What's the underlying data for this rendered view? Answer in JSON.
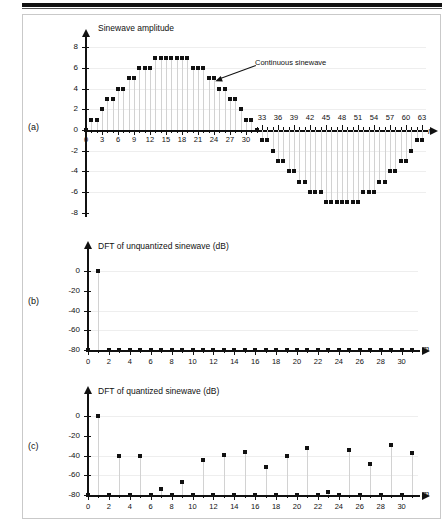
{
  "figure": {
    "panels": [
      {
        "letter": "(a)",
        "ylabel": "Sinewave amplitude",
        "xvar": "n",
        "annotation": "Continuous sinewave"
      },
      {
        "letter": "(b)",
        "ylabel": "DFT of unquantized sinewave (dB)",
        "xvar": "m"
      },
      {
        "letter": "(c)",
        "ylabel": "DFT of quantized sinewave (dB)",
        "xvar": "m"
      }
    ]
  },
  "chart_data": [
    {
      "type": "scatter",
      "panel": "a",
      "title": "Sinewave amplitude",
      "xlabel": "n",
      "ylabel": "Sinewave amplitude",
      "xlim": [
        0,
        64
      ],
      "ylim": [
        -8,
        8
      ],
      "yticks": [
        8,
        6,
        4,
        2,
        0,
        -2,
        -4,
        -6,
        -8
      ],
      "ytick_labels": [
        "8",
        "6",
        "4",
        "2",
        "0",
        "-2",
        "-4",
        "-6",
        "-8"
      ],
      "xticks_below": [
        0,
        3,
        6,
        9,
        12,
        15,
        18,
        21,
        24,
        27,
        30
      ],
      "xticks_above": [
        33,
        36,
        39,
        42,
        45,
        48,
        51,
        54,
        57,
        60,
        63
      ],
      "grid": true,
      "x": [
        0,
        1,
        2,
        3,
        4,
        5,
        6,
        7,
        8,
        9,
        10,
        11,
        12,
        13,
        14,
        15,
        16,
        17,
        18,
        19,
        20,
        21,
        22,
        23,
        24,
        25,
        26,
        27,
        28,
        29,
        30,
        31,
        32,
        33,
        34,
        35,
        36,
        37,
        38,
        39,
        40,
        41,
        42,
        43,
        44,
        45,
        46,
        47,
        48,
        49,
        50,
        51,
        52,
        53,
        54,
        55,
        56,
        57,
        58,
        59,
        60,
        61,
        62,
        63
      ],
      "values": [
        0,
        1,
        1,
        2,
        3,
        3,
        4,
        4,
        5,
        5,
        6,
        6,
        6,
        7,
        7,
        7,
        7,
        7,
        7,
        7,
        6,
        6,
        6,
        5,
        5,
        4,
        4,
        3,
        3,
        2,
        1,
        1,
        0,
        -1,
        -1,
        -2,
        -3,
        -3,
        -4,
        -4,
        -5,
        -5,
        -6,
        -6,
        -6,
        -7,
        -7,
        -7,
        -7,
        -7,
        -7,
        -7,
        -6,
        -6,
        -6,
        -5,
        -5,
        -4,
        -4,
        -3,
        -3,
        -2,
        -1,
        -1
      ],
      "annotations": [
        {
          "text": "Continuous sinewave",
          "points_to_x": 24,
          "points_to_y": 5
        }
      ]
    },
    {
      "type": "scatter",
      "panel": "b",
      "title": "DFT of unquantized sinewave (dB)",
      "xlabel": "m",
      "ylabel": "DFT of unquantized sinewave (dB)",
      "xlim": [
        0,
        31
      ],
      "ylim": [
        -80,
        5
      ],
      "yticks": [
        0,
        -20,
        -40,
        -60,
        -80
      ],
      "ytick_labels": [
        "0",
        "-20",
        "-40",
        "-60",
        "-80"
      ],
      "xticks": [
        0,
        2,
        4,
        6,
        8,
        10,
        12,
        14,
        16,
        18,
        20,
        22,
        24,
        26,
        28,
        30
      ],
      "grid": true,
      "x": [
        0,
        1,
        2,
        3,
        4,
        5,
        6,
        7,
        8,
        9,
        10,
        11,
        12,
        13,
        14,
        15,
        16,
        17,
        18,
        19,
        20,
        21,
        22,
        23,
        24,
        25,
        26,
        27,
        28,
        29,
        30,
        31
      ],
      "values": [
        -80,
        0,
        -80,
        -80,
        -80,
        -80,
        -80,
        -80,
        -80,
        -80,
        -80,
        -80,
        -80,
        -80,
        -80,
        -80,
        -80,
        -80,
        -80,
        -80,
        -80,
        -80,
        -80,
        -80,
        -80,
        -80,
        -80,
        -80,
        -80,
        -80,
        -80,
        -80
      ]
    },
    {
      "type": "scatter",
      "panel": "c",
      "title": "DFT of quantized sinewave (dB)",
      "xlabel": "m",
      "ylabel": "DFT of quantized sinewave (dB)",
      "xlim": [
        0,
        31
      ],
      "ylim": [
        -80,
        5
      ],
      "yticks": [
        0,
        -20,
        -40,
        -60,
        -80
      ],
      "ytick_labels": [
        "0",
        "-20",
        "-40",
        "-60",
        "-80"
      ],
      "xticks": [
        0,
        2,
        4,
        6,
        8,
        10,
        12,
        14,
        16,
        18,
        20,
        22,
        24,
        26,
        28,
        30
      ],
      "grid": true,
      "x": [
        0,
        1,
        2,
        3,
        4,
        5,
        6,
        7,
        8,
        9,
        10,
        11,
        12,
        13,
        14,
        15,
        16,
        17,
        18,
        19,
        20,
        21,
        22,
        23,
        24,
        25,
        26,
        27,
        28,
        29,
        30,
        31
      ],
      "values": [
        -80,
        0,
        -80,
        -41,
        -80,
        -40.5,
        -80,
        -74,
        -80,
        -67,
        -80,
        -45,
        -80,
        -39.5,
        -80,
        -36,
        -80,
        -52,
        -80,
        -40,
        -80,
        -32.5,
        -80,
        -77,
        -80,
        -34,
        -80,
        -48.5,
        -80,
        -29,
        -80,
        -37
      ]
    }
  ]
}
